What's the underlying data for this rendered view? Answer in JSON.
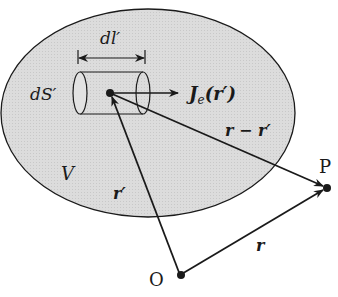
{
  "diagram": {
    "type": "physics-vector-diagram",
    "region_label": "V",
    "element": {
      "length_label": "dl′",
      "area_label": "dS′",
      "current_label_main": "J",
      "current_label_sub": "e",
      "current_label_arg": "(r′)"
    },
    "vectors": {
      "source_position": "r′",
      "difference": "r − r′",
      "field_position": "r"
    },
    "points": {
      "origin": "O",
      "field_point": "P"
    },
    "colors": {
      "region_fill": "#d9d9d9",
      "stroke": "#1a1a1a"
    }
  }
}
